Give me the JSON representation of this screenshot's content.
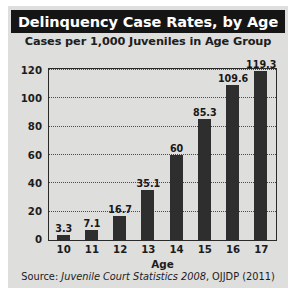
{
  "chart_data": {
    "type": "bar",
    "title": "Delinquency Case Rates, by Age",
    "subtitle": "Cases per 1,000 Juveniles in Age Group",
    "xlabel": "Age",
    "ylabel": "",
    "categories": [
      "10",
      "11",
      "12",
      "13",
      "14",
      "15",
      "16",
      "17"
    ],
    "values": [
      3.3,
      7.1,
      16.7,
      35.1,
      60,
      85.3,
      109.6,
      119.3
    ],
    "value_labels": [
      "3.3",
      "7.1",
      "16.7",
      "35.1",
      "60",
      "85.3",
      "109.6",
      "119.3"
    ],
    "ylim": [
      0,
      120
    ],
    "yticks": [
      0,
      20,
      40,
      60,
      80,
      100,
      120
    ],
    "ytick_labels": [
      "0",
      "20",
      "40",
      "60",
      "80",
      "100",
      "120"
    ],
    "grid": "horizontal-dotted",
    "legend": "none",
    "bar_color": "#2e2e2e",
    "plot_background": "#dededd"
  },
  "source": {
    "prefix": "Source: ",
    "italic_part": "Juvenile Court Statistics 2008",
    "suffix": ", OJJDP (2011)"
  }
}
